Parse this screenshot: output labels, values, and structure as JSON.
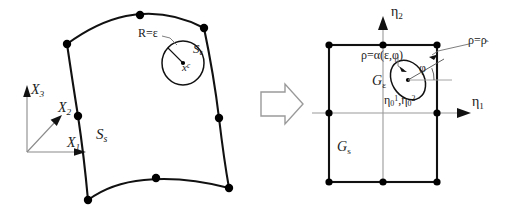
{
  "figure": {
    "kind": "mathematical-diagram",
    "colors": {
      "stroke": "#111111",
      "thin_stroke": "#8a8a8a",
      "node_fill": "#000000",
      "background": "#ffffff"
    }
  },
  "left_panel": {
    "name": "physical-element",
    "axes": {
      "x1_label": "X",
      "x1_sub": "1",
      "x2_label": "X",
      "x2_sub": "2",
      "x3_label": "X",
      "x3_sub": "3"
    },
    "surface_label": "S",
    "surface_sub": "s",
    "singular_patch_label": "S",
    "singular_patch_sub": "ε",
    "radius_label": "R=ε",
    "center_point_label": "x",
    "center_point_sup": "c",
    "node_count": 8
  },
  "transform_arrow": {
    "name": "mapping-arrow",
    "direction": "right"
  },
  "right_panel": {
    "name": "reference-element",
    "axes": {
      "eta1_label": "η",
      "eta1_sub": "1",
      "eta2_label": "η",
      "eta2_sub": "2"
    },
    "domain_label": "G",
    "domain_sub": "s",
    "subdomain_label": "G",
    "subdomain_sub": "ε",
    "rho_alpha_label": "ρ=α(ε,φ)",
    "rho_hat_label_prefix": "ρ=ρ",
    "rho_hat_accent": "ˆ",
    "angle_label": "φ",
    "source_point_eta": "η",
    "source_point_sub": "0",
    "source_point_sup1": "1",
    "source_point_sup2": "2",
    "source_point_separator": ",",
    "node_count": 8
  }
}
